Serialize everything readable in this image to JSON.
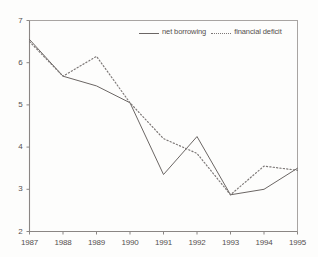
{
  "chart_data": {
    "type": "line",
    "title": "",
    "subtitle": "",
    "xlabel": "",
    "ylabel": "",
    "categories": [
      "1987",
      "1988",
      "1989",
      "1990",
      "1991",
      "1992",
      "1993",
      "1994",
      "1995"
    ],
    "x": [
      1987,
      1988,
      1989,
      1990,
      1991,
      1992,
      1993,
      1994,
      1995
    ],
    "xlim": [
      1987,
      1995
    ],
    "ylim": [
      2,
      7
    ],
    "yticks": [
      "2",
      "3",
      "4",
      "5",
      "6",
      "7"
    ],
    "ytick_values": [
      2,
      3,
      4,
      5,
      6,
      7
    ],
    "grid": false,
    "legend_position": "top-right",
    "series": [
      {
        "name": "net borrowing",
        "style": "solid",
        "color": "#6b6664",
        "values": [
          6.55,
          5.68,
          5.45,
          5.05,
          3.35,
          4.25,
          2.87,
          3.0,
          3.5
        ]
      },
      {
        "name": "financial deficit",
        "style": "dotted",
        "color": "#7d7877",
        "values": [
          6.5,
          5.68,
          6.15,
          5.05,
          4.2,
          3.85,
          2.87,
          3.55,
          3.45
        ]
      }
    ]
  },
  "legend": {
    "entries": [
      {
        "label": "net borrowing",
        "style": "solid"
      },
      {
        "label": "financial deficit",
        "style": "dotted"
      }
    ]
  },
  "axes": {
    "y_labels": [
      "7",
      "6",
      "5",
      "4",
      "3",
      "2"
    ],
    "x_labels": [
      "1987",
      "1988",
      "1989",
      "1990",
      "1991",
      "1992",
      "1993",
      "1994",
      "1995"
    ]
  },
  "colors": {
    "axis": "#8a8684",
    "series_solid": "#6b6664",
    "series_dotted": "#7d7877",
    "text": "#55504e",
    "background": "#fdfdfc"
  }
}
